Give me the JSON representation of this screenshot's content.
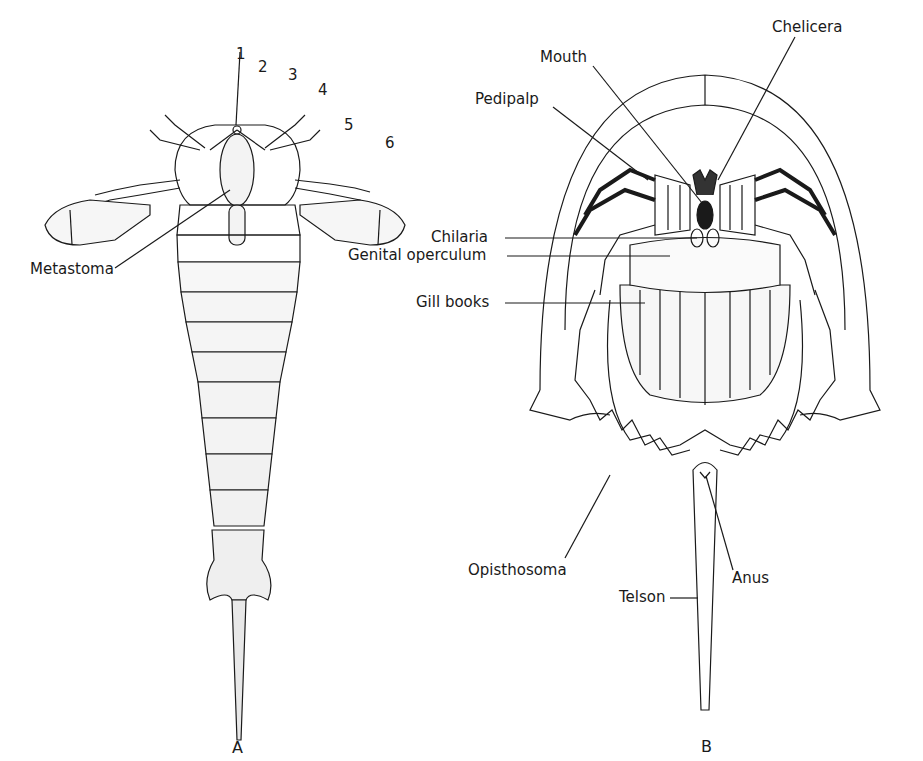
{
  "figure": {
    "panels": [
      {
        "id": "A",
        "label": "A",
        "subject": "eurypterid (ventral view)"
      },
      {
        "id": "B",
        "label": "B",
        "subject": "horseshoe crab (ventral view)"
      }
    ],
    "panel_a": {
      "appendage_numbers": [
        "1",
        "2",
        "3",
        "4",
        "5",
        "6"
      ],
      "labels": {
        "metastoma": "Metastoma"
      }
    },
    "panel_b": {
      "labels": {
        "mouth": "Mouth",
        "chelicera": "Chelicera",
        "pedipalp": "Pedipalp",
        "chilaria": "Chilaria",
        "genital_operculum": "Genital operculum",
        "gill_books": "Gill books",
        "opisthosoma": "Opisthosoma",
        "anus": "Anus",
        "telson": "Telson"
      }
    },
    "colors": {
      "ink": "#1a1a1a",
      "background": "#ffffff"
    }
  }
}
